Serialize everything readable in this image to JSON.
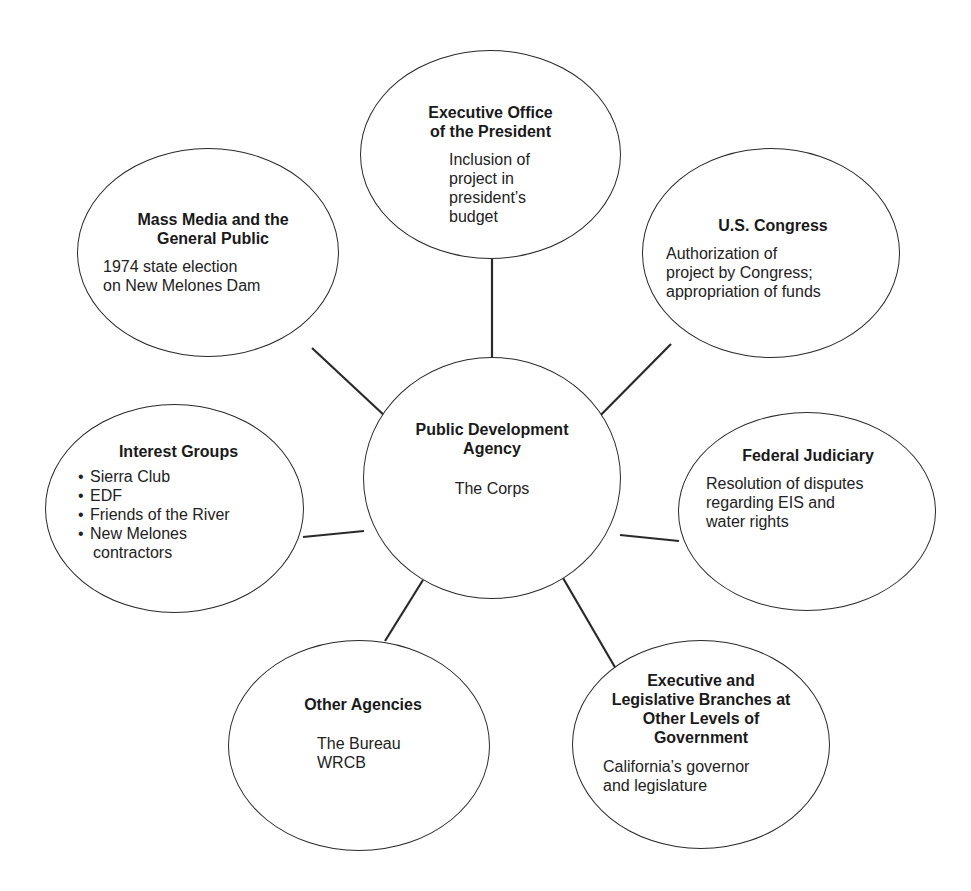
{
  "diagram": {
    "type": "hub-and-spoke",
    "center": {
      "title": "Public Development Agency",
      "title_lines": [
        "Public Development",
        "Agency"
      ],
      "subtitle": "The Corps"
    },
    "nodes": [
      {
        "id": "executive-office",
        "title_lines": [
          "Executive Office",
          "of the President"
        ],
        "desc_lines": [
          "Inclusion of",
          "project in",
          "president’s",
          "budget"
        ]
      },
      {
        "id": "us-congress",
        "title_lines": [
          "U.S. Congress"
        ],
        "desc_lines": [
          "Authorization of",
          "project by Congress;",
          "appropriation of funds"
        ]
      },
      {
        "id": "federal-judiciary",
        "title_lines": [
          "Federal Judiciary"
        ],
        "desc_lines": [
          "Resolution of disputes",
          "regarding EIS and",
          "water rights"
        ]
      },
      {
        "id": "other-levels-government",
        "title_lines": [
          "Executive and",
          "Legislative Branches at",
          "Other Levels of",
          "Government"
        ],
        "desc_lines": [
          "California’s governor",
          "and legislature"
        ]
      },
      {
        "id": "other-agencies",
        "title_lines": [
          "Other Agencies"
        ],
        "desc_lines": [
          "The Bureau",
          "WRCB"
        ]
      },
      {
        "id": "interest-groups",
        "title_lines": [
          "Interest Groups"
        ],
        "items": [
          "Sierra Club",
          "EDF",
          "Friends of the River",
          "New Melones",
          "contractors"
        ]
      },
      {
        "id": "mass-media",
        "title_lines": [
          "Mass Media and the",
          "General Public"
        ],
        "desc_lines": [
          "1974 state election",
          "on New Melones Dam"
        ]
      }
    ],
    "bullet_glyph": "•",
    "colors": {
      "line": "#2a2a2a",
      "background": "#ffffff",
      "text": "#1a1a1a"
    }
  }
}
